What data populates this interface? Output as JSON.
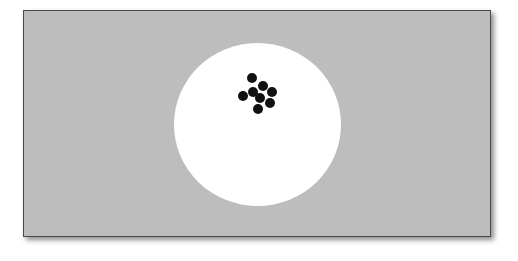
{
  "scene": {
    "frame": {
      "background": "#bdbdbd",
      "border": "#4a4a4a"
    },
    "disc": {
      "color": "#ffffff",
      "center": [
        257,
        124
      ],
      "radius": 82
    },
    "dots": {
      "count": 8,
      "color": "#111111",
      "radius": 5,
      "positions": [
        [
          252,
          78
        ],
        [
          263,
          86
        ],
        [
          253,
          92
        ],
        [
          272,
          92
        ],
        [
          243,
          96
        ],
        [
          260,
          98
        ],
        [
          270,
          103
        ],
        [
          258,
          109
        ]
      ]
    }
  }
}
